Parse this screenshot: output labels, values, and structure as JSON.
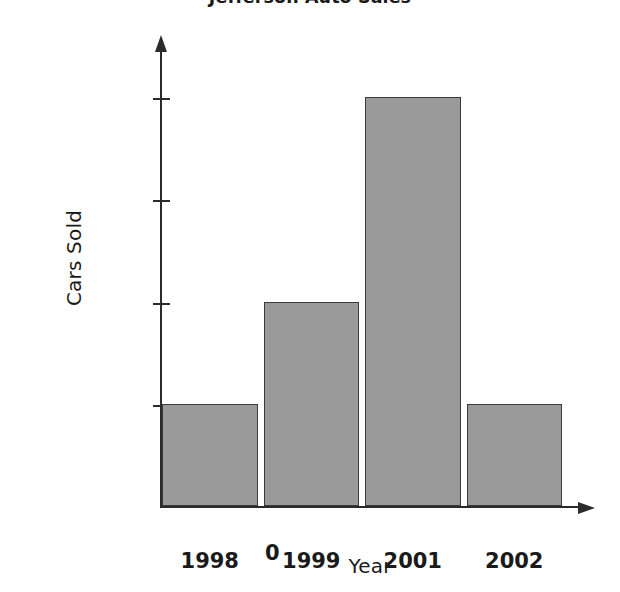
{
  "chart_data": {
    "type": "bar",
    "title": "Jefferson Auto Sales",
    "xlabel": "Year",
    "ylabel": "Cars Sold",
    "categories": [
      "1998",
      "1999",
      "2001",
      "2002"
    ],
    "values": [
      1000,
      2000,
      4000,
      1000
    ],
    "ytick_labels": [
      "4,000",
      "3,000",
      "2,000",
      "1,000"
    ],
    "ytick_values": [
      4000,
      3000,
      2000,
      1000
    ],
    "origin_label": "0",
    "ylim": [
      0,
      4600
    ],
    "grid": false,
    "legend": false,
    "bar_fill_color": "#9a9a9a",
    "bar_edge_color": "#3a3a3a",
    "axis_color": "#2b2b2b",
    "background_color": "#ffffff"
  },
  "axes": {
    "y_arrow": "arrow-up",
    "x_arrow": "arrow-right"
  }
}
